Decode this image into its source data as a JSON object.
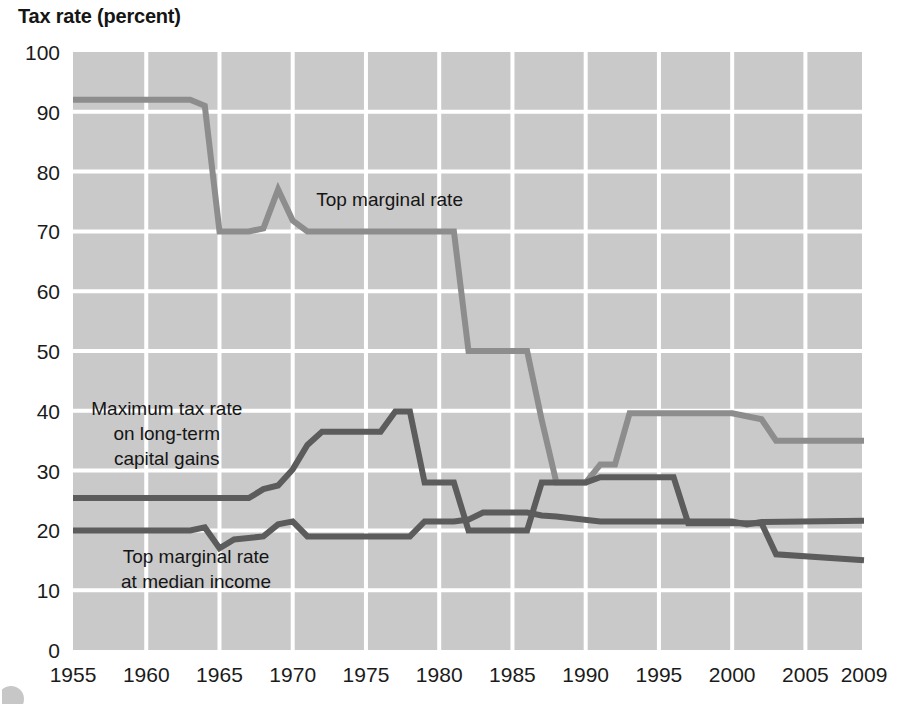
{
  "chart_data": {
    "type": "line",
    "title": "Tax rate (percent)",
    "xlabel": "",
    "ylabel": "Tax rate (percent)",
    "xlim": [
      1955,
      2009
    ],
    "ylim": [
      0,
      100
    ],
    "xticks": [
      "1955",
      "1960",
      "1965",
      "1970",
      "1975",
      "1980",
      "1985",
      "1990",
      "1995",
      "2000",
      "2005",
      "2009"
    ],
    "yticks": [
      "0",
      "10",
      "20",
      "30",
      "40",
      "50",
      "60",
      "70",
      "80",
      "90",
      "100"
    ],
    "grid": true,
    "legend_position": "inline-annotations",
    "plot_background": "#c9c9c9",
    "gridline_color": "#ffffff",
    "annotations": [
      {
        "name": "top-marginal-rate-label",
        "lines": [
          "Top marginal rate"
        ],
        "x": 1971.6,
        "y": 74.2
      },
      {
        "name": "capital-gains-label",
        "lines": [
          "Maximum tax rate",
          "on long-term",
          "capital gains"
        ],
        "x": 1956.3,
        "y": 39.3
      },
      {
        "name": "median-income-label",
        "lines": [
          "Top marginal rate",
          "at median income"
        ],
        "x": 1959.2,
        "y": 14.6
      }
    ],
    "series": [
      {
        "name": "Top marginal rate",
        "color": "#8d8d8d",
        "width": 6,
        "x": [
          1955,
          1963,
          1964,
          1965,
          1967,
          1968,
          1969,
          1970,
          1971,
          1981,
          1982,
          1986,
          1987,
          1988,
          1990,
          1991,
          1992,
          1993,
          2000,
          2001,
          2002,
          2003,
          2009
        ],
        "values": [
          92,
          92,
          91,
          70,
          70,
          70.5,
          77,
          71.8,
          70,
          70,
          50,
          50,
          38.5,
          28,
          28,
          31,
          31,
          39.6,
          39.6,
          39.1,
          38.6,
          35,
          35
        ]
      },
      {
        "name": "Maximum tax rate on long-term capital gains",
        "color": "#5c5c5c",
        "width": 6,
        "x": [
          1955,
          1967,
          1968,
          1969,
          1970,
          1971,
          1972,
          1976,
          1977,
          1978,
          1979,
          1980,
          1981,
          1982,
          1986,
          1987,
          1988,
          1990,
          1991,
          1996,
          1997,
          2002,
          2003,
          2009
        ],
        "values": [
          25.4,
          25.4,
          26.9,
          27.5,
          30.2,
          34.3,
          36.5,
          36.5,
          39.9,
          39.9,
          28,
          28,
          28,
          20,
          20,
          28,
          28,
          28,
          28.9,
          28.9,
          21.2,
          21.2,
          16,
          15
        ]
      },
      {
        "name": "Top marginal rate at median income",
        "color": "#5c5c5c",
        "width": 6,
        "x": [
          1955,
          1963,
          1964,
          1965,
          1966,
          1968,
          1969,
          1970,
          1971,
          1976,
          1977,
          1978,
          1979,
          1981,
          1982,
          1983,
          1984,
          1986,
          1987,
          1988,
          1991,
          2000,
          2001,
          2002,
          2009
        ],
        "values": [
          20,
          20,
          20.5,
          17,
          18.5,
          19,
          21,
          21.5,
          19,
          19,
          19,
          19,
          21.5,
          21.5,
          21.8,
          23,
          23,
          23,
          22.5,
          22.3,
          21.5,
          21.5,
          21,
          21.4,
          21.6
        ]
      }
    ]
  }
}
